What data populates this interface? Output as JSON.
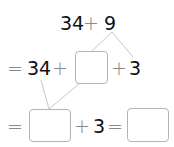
{
  "problem": {
    "line1": {
      "a": "34",
      "op": "+",
      "b": "9"
    },
    "line2": {
      "eq": "=",
      "a": "34",
      "op1": "+",
      "blank": "",
      "op2": "+",
      "c": "3"
    },
    "line3": {
      "eq": "=",
      "blank1": "",
      "op": "+",
      "c": "3",
      "eq2": "=",
      "blank2": ""
    }
  },
  "colors": {
    "text": "#111111",
    "operator": "#888888",
    "box_border": "#b4b4b4",
    "lines": "#c8c8c8"
  }
}
